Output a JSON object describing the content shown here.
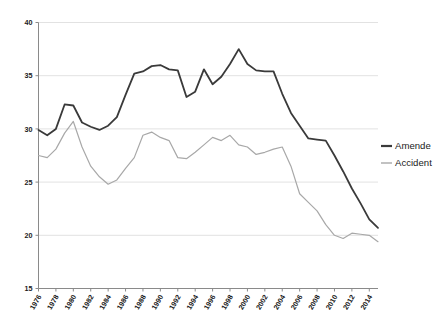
{
  "chart_data": {
    "type": "line",
    "title": "",
    "subtitle": "",
    "xlabel": "",
    "ylabel": "",
    "grid": true,
    "grid_axis": "y",
    "legend_position": "right",
    "xlim": [
      1976,
      2015
    ],
    "ylim": [
      15,
      40
    ],
    "yticks": [
      15,
      20,
      25,
      30,
      35,
      40
    ],
    "ytick_labels": [
      "15",
      "20",
      "25",
      "30",
      "35",
      "40"
    ],
    "x": [
      1976,
      1977,
      1978,
      1979,
      1980,
      1981,
      1982,
      1983,
      1984,
      1985,
      1986,
      1987,
      1988,
      1989,
      1990,
      1991,
      1992,
      1993,
      1994,
      1995,
      1996,
      1997,
      1998,
      1999,
      2000,
      2001,
      2002,
      2003,
      2004,
      2005,
      2006,
      2007,
      2008,
      2009,
      2010,
      2011,
      2012,
      2013,
      2014,
      2015
    ],
    "xtick_labels": [
      "1976",
      "1978",
      "1980",
      "1982",
      "1984",
      "1986",
      "1988",
      "1990",
      "1992",
      "1994",
      "1996",
      "1998",
      "2000",
      "2002",
      "2004",
      "2006",
      "2008",
      "2010",
      "2012",
      "2014"
    ],
    "xticks": [
      1976,
      1978,
      1980,
      1982,
      1984,
      1986,
      1988,
      1990,
      1992,
      1994,
      1996,
      1998,
      2000,
      2002,
      2004,
      2006,
      2008,
      2010,
      2012,
      2014
    ],
    "series": [
      {
        "name": "Amende",
        "color": "#3a3a3a",
        "width": 1.8,
        "values": [
          29.9,
          29.4,
          30.0,
          32.3,
          32.2,
          30.6,
          30.2,
          29.9,
          30.3,
          31.1,
          33.2,
          35.2,
          35.4,
          35.9,
          36.0,
          35.6,
          35.5,
          33.0,
          33.5,
          35.6,
          34.2,
          34.9,
          36.1,
          37.5,
          36.1,
          35.5,
          35.4,
          35.4,
          33.3,
          31.5,
          30.3,
          29.1,
          29.0,
          28.9,
          27.5,
          26.0,
          24.4,
          23.0,
          21.5,
          20.7
        ]
      },
      {
        "name": "Accident",
        "color": "#a8a8a8",
        "width": 1.2,
        "values": [
          27.5,
          27.3,
          28.1,
          29.6,
          30.7,
          28.3,
          26.5,
          25.5,
          24.8,
          25.2,
          26.3,
          27.3,
          29.4,
          29.7,
          29.2,
          28.9,
          27.3,
          27.2,
          27.8,
          28.5,
          29.2,
          28.9,
          29.4,
          28.5,
          28.3,
          27.6,
          27.8,
          28.1,
          28.3,
          26.5,
          23.9,
          23.1,
          22.3,
          21.0,
          20.0,
          19.7,
          20.2,
          20.1,
          20.0,
          19.4
        ]
      }
    ],
    "legend": [
      {
        "label": "Amende",
        "color": "#3a3a3a",
        "width": 2.2
      },
      {
        "label": "Accident",
        "color": "#a8a8a8",
        "width": 1.4
      }
    ]
  },
  "style": {
    "background": "#ffffff",
    "grid_color": "#e2e2e2",
    "axis_color": "#8a8a8a",
    "text_color": "#1a1a1a"
  }
}
